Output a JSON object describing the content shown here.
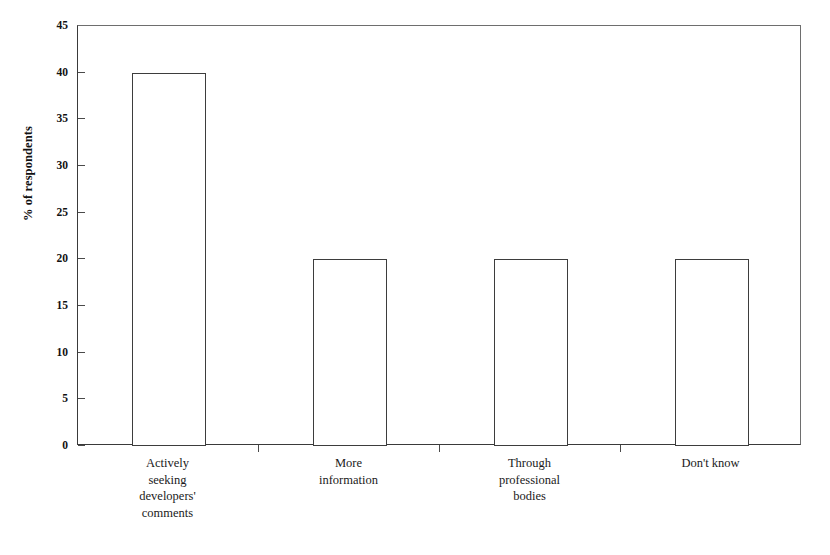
{
  "chart_data": {
    "type": "bar",
    "title": "",
    "subtitle": "",
    "xlabel": "",
    "ylabel": "% of respondents",
    "categories": [
      "Actively seeking developers' comments",
      "More information",
      "Through professional bodies",
      "Don't know"
    ],
    "category_lines": [
      [
        "Actively",
        "seeking",
        "developers'",
        "comments"
      ],
      [
        "More",
        "information"
      ],
      [
        "Through",
        "professional",
        "bodies"
      ],
      [
        "Don't know"
      ]
    ],
    "values": [
      40,
      20,
      20,
      20
    ],
    "ylim": [
      0,
      45
    ],
    "ytick_step": 5,
    "yticks": [
      0,
      5,
      10,
      15,
      20,
      25,
      30,
      35,
      40,
      45
    ],
    "ytick_labels": [
      "0",
      "5",
      "10",
      "15",
      "20",
      "25",
      "30",
      "35",
      "40",
      "45"
    ],
    "grid": false,
    "legend": false,
    "legend_position": "none",
    "bar_fill_color": "#ffffff",
    "bar_border_color": "#3d3d3d",
    "axis_color": "#3a3a3a",
    "background_color": "#ffffff"
  },
  "caption": {
    "fragment": ""
  }
}
